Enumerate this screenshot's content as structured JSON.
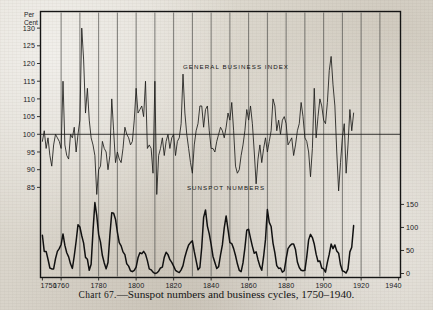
{
  "caption": {
    "chart_label": "Chart 67.",
    "dash": "—",
    "text": "Sunspot numbers and business cycles, 1750–1940."
  },
  "annotations": {
    "business_label": "GENERAL  BUSINESS  INDEX",
    "sunspot_label": "SUNSPOT  NUMBERS"
  },
  "axes": {
    "left_title_line1": "Per",
    "left_title_line2": "Cent",
    "left_ticks": [
      "130",
      "125",
      "120",
      "115",
      "110",
      "105",
      "100",
      "95",
      "90",
      "85"
    ],
    "right_ticks": [
      "150",
      "100",
      "50",
      "0"
    ],
    "x_ticks": [
      "1750",
      "1760",
      "1780",
      "1800",
      "1820",
      "1840",
      "1860",
      "1880",
      "1900",
      "1920",
      "1940"
    ]
  },
  "colors": {
    "ink": "#1a1a1a",
    "paper": "#ddd9d0",
    "gridline": "#4a4a48",
    "frame": "#151515"
  },
  "chart_data": {
    "type": "line",
    "title": "Chart 67.—Sunspot numbers and business cycles, 1750–1940.",
    "xlabel": "",
    "ylabel": "Per Cent",
    "y2label": "Sunspot Numbers",
    "xlim": [
      1749,
      1941
    ],
    "ylim": [
      82,
      133
    ],
    "y2lim": [
      0,
      190
    ],
    "grid": "vertical decadal gridlines",
    "legend": "inline labels inside plot area",
    "series": [
      {
        "name": "GENERAL BUSINESS INDEX",
        "axis": "left",
        "units": "per cent of trend (100 = normal)",
        "x_start": 1750,
        "x_step": 1,
        "values": [
          98,
          101,
          96,
          99,
          94,
          91,
          97,
          100,
          99,
          98,
          96,
          115,
          97,
          94,
          93,
          100,
          99,
          102,
          95,
          100,
          104,
          130,
          121,
          106,
          113,
          104,
          99,
          97,
          94,
          83,
          90,
          91,
          98,
          96,
          95,
          90,
          94,
          110,
          101,
          92,
          95,
          93,
          92,
          96,
          102,
          100,
          99,
          97,
          98,
          104,
          113,
          106,
          107,
          108,
          105,
          115,
          96,
          97,
          96,
          89,
          115,
          83,
          94,
          96,
          99,
          94,
          98,
          100,
          96,
          99,
          100,
          94,
          98,
          99,
          103,
          117,
          106,
          100,
          96,
          92,
          89,
          97,
          101,
          103,
          108,
          108,
          102,
          107,
          108,
          101,
          96,
          96,
          95,
          98,
          100,
          102,
          101,
          99,
          102,
          106,
          104,
          109,
          101,
          91,
          89,
          90,
          94,
          97,
          101,
          107,
          104,
          108,
          103,
          95,
          86,
          93,
          97,
          92,
          96,
          99,
          95,
          98,
          101,
          110,
          108,
          101,
          104,
          100,
          104,
          105,
          103,
          97,
          98,
          99,
          94,
          97,
          101,
          103,
          109,
          105,
          99,
          98,
          95,
          88,
          96,
          113,
          99,
          105,
          110,
          108,
          104,
          103,
          109,
          118,
          122,
          114,
          108,
          95,
          84,
          92,
          99,
          103,
          89,
          97,
          107,
          101,
          106
        ],
        "notable_points": [
          {
            "year": 1771,
            "value": 130,
            "note": "highest business index peak"
          },
          {
            "year": 1779,
            "value": 83,
            "note": "deep early trough"
          },
          {
            "year": 1761,
            "value": 115
          },
          {
            "year": 1787,
            "value": 110
          },
          {
            "year": 1800,
            "value": 113
          },
          {
            "year": 1806,
            "value": 115
          },
          {
            "year": 1811,
            "value": 83,
            "note": "trough"
          },
          {
            "year": 1825,
            "value": 117
          },
          {
            "year": 1836,
            "value": 117
          },
          {
            "year": 1864,
            "value": 109
          },
          {
            "year": 1873,
            "value": 108
          },
          {
            "year": 1893,
            "value": 86,
            "note": "panic trough"
          },
          {
            "year": 1907,
            "value": 110
          },
          {
            "year": 1914,
            "value": 88
          },
          {
            "year": 1929,
            "value": 122,
            "note": "pre-Depression peak"
          },
          {
            "year": 1932,
            "value": 84,
            "note": "Great Depression trough"
          }
        ]
      },
      {
        "name": "SUNSPOT NUMBERS",
        "axis": "right",
        "units": "Wolf relative sunspot number (annual mean)",
        "x_start": 1750,
        "x_step": 1,
        "values": [
          83,
          48,
          48,
          31,
          12,
          10,
          10,
          32,
          48,
          54,
          63,
          86,
          61,
          45,
          36,
          21,
          11,
          38,
          70,
          106,
          101,
          82,
          66,
          35,
          31,
          7,
          20,
          92,
          154,
          126,
          85,
          68,
          39,
          23,
          10,
          24,
          83,
          132,
          131,
          118,
          90,
          67,
          60,
          47,
          41,
          21,
          16,
          6,
          4,
          7,
          14,
          34,
          45,
          43,
          48,
          42,
          28,
          10,
          8,
          3,
          0,
          1,
          5,
          12,
          14,
          35,
          46,
          41,
          30,
          24,
          16,
          7,
          4,
          2,
          8,
          17,
          36,
          50,
          62,
          67,
          71,
          48,
          28,
          8,
          13,
          57,
          122,
          138,
          103,
          86,
          63,
          37,
          24,
          11,
          15,
          40,
          62,
          99,
          125,
          96,
          67,
          65,
          54,
          39,
          21,
          7,
          4,
          23,
          55,
          94,
          96,
          77,
          59,
          44,
          47,
          30,
          16,
          7,
          37,
          74,
          139,
          111,
          102,
          66,
          45,
          17,
          11,
          12,
          3,
          6,
          32,
          54,
          60,
          64,
          64,
          52,
          25,
          13,
          7,
          6,
          7,
          36,
          73,
          85,
          78,
          64,
          42,
          26,
          27,
          12,
          10,
          3,
          24,
          42,
          64,
          54,
          62,
          49,
          44,
          19,
          6,
          4,
          1,
          10,
          47,
          57,
          104
        ],
        "notable_points": [
          {
            "year": 1778,
            "value": 154,
            "note": "tallest early maximum"
          },
          {
            "year": 1788,
            "value": 132
          },
          {
            "year": 1787,
            "value": 131
          },
          {
            "year": 1837,
            "value": 138,
            "note": "high maximum"
          },
          {
            "year": 1848,
            "value": 125
          },
          {
            "year": 1870,
            "value": 139,
            "note": "high maximum"
          },
          {
            "year": 1810,
            "value": 0,
            "note": "Dalton minimum, zero sunspots"
          },
          {
            "year": 1913,
            "value": 3,
            "note": "deep minimum"
          },
          {
            "year": 1937,
            "value": 114,
            "note": "late maximum"
          }
        ],
        "period_note": "roughly 11-year solar cycle"
      }
    ]
  }
}
